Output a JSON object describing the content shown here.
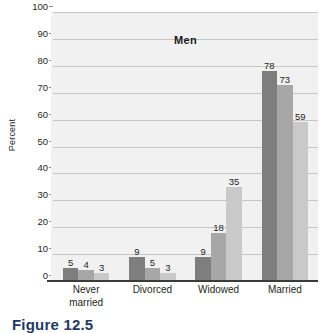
{
  "chart_data": {
    "type": "bar",
    "title": "Men",
    "xlabel": "",
    "ylabel": "Percent",
    "ylim": [
      0,
      100
    ],
    "ytick_step": 10,
    "yticks": [
      100,
      90,
      80,
      70,
      60,
      50,
      40,
      30,
      20,
      10,
      0
    ],
    "grid": true,
    "legend_position": "none",
    "categories": [
      "Never married",
      "Divorced",
      "Widowed",
      "Married"
    ],
    "category_lines": [
      [
        "Never",
        "married"
      ],
      [
        "Divorced"
      ],
      [
        "Widowed"
      ],
      [
        "Married"
      ]
    ],
    "series": [
      {
        "name": "series-1",
        "color": "#7e7e7e",
        "values": [
          5,
          9,
          9,
          78
        ]
      },
      {
        "name": "series-2",
        "color": "#a7a7a7",
        "values": [
          4,
          5,
          18,
          73
        ]
      },
      {
        "name": "series-3",
        "color": "#c9c9c9",
        "values": [
          3,
          3,
          35,
          59
        ]
      }
    ],
    "data_labels": [
      [
        "5",
        "4",
        "3"
      ],
      [
        "9",
        "5",
        "3"
      ],
      [
        "9",
        "18",
        "35"
      ],
      [
        "78",
        "73",
        "59"
      ]
    ],
    "colors": {
      "plot_background": "#f1f1f1",
      "gridline": "#c6c6c6",
      "axis": "#3b3b3b",
      "text": "#231f20",
      "caption": "#1f3864"
    }
  },
  "figure": {
    "caption": "Figure 12.5"
  }
}
